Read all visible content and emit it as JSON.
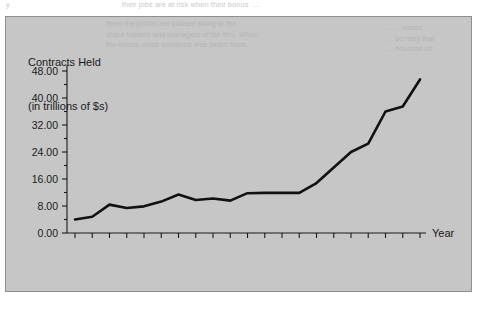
{
  "page": {
    "bleed_top": "y                                                    their jobs are at risk when their bonus  ...",
    "bleed_right": "...... losses\n... so risky that\n... financial cri",
    "bleed_bottom": "",
    "panel_bleed_a": "them the profits are passed along to the\nshare holders and managers of the firm. When\nthe losses occur someone else bears them.",
    "panel_bleed_b": "...... losses\n... so risky that\n... financial cri",
    "panel_bleed_c": ""
  },
  "chart": {
    "title_line1": "Contracts Held",
    "title_line2": "(in trillions of $s)",
    "x_axis_name": "Year"
  },
  "chart_data": {
    "type": "line",
    "title": "Contracts Held (in trillions of $s)",
    "xlabel": "Year",
    "ylabel": "Contracts Held (in trillions of $s)",
    "ylim": [
      0,
      48
    ],
    "yticks": [
      "0.00",
      "8.00",
      "16.00",
      "24.00",
      "32.00",
      "40.00",
      "48.00"
    ],
    "ytick_values": [
      0,
      8,
      16,
      24,
      32,
      40,
      48
    ],
    "xticks": [
      "Dec-92",
      "Dec-94",
      "Dec-96",
      "Dec-98",
      "Dec-00",
      "Dec-02",
      "Dec-04",
      "Dec-06",
      "Dec-08",
      "Dec-10",
      "Dec-12"
    ],
    "grid": false,
    "legend": "none",
    "x": [
      "Dec-92",
      "Dec-93",
      "Dec-94",
      "Dec-95",
      "Dec-96",
      "Dec-97",
      "Dec-98",
      "Dec-99",
      "Dec-00",
      "Dec-01",
      "Dec-02",
      "Dec-03",
      "Dec-04",
      "Dec-05",
      "Dec-06",
      "Dec-07",
      "Dec-08",
      "Dec-09",
      "Dec-10",
      "Dec-11",
      "Dec-12"
    ],
    "values": [
      4.0,
      4.8,
      8.4,
      7.4,
      7.9,
      9.3,
      11.4,
      9.8,
      10.2,
      9.6,
      11.8,
      11.9,
      11.9,
      11.9,
      14.8,
      19.4,
      24.0,
      26.5,
      36.0,
      37.5,
      45.5
    ],
    "series": [
      {
        "name": "Contracts Held",
        "values": [
          4.0,
          4.8,
          8.4,
          7.4,
          7.9,
          9.3,
          11.4,
          9.8,
          10.2,
          9.6,
          11.8,
          11.9,
          11.9,
          11.9,
          14.8,
          19.4,
          24.0,
          26.5,
          36.0,
          37.5,
          45.5
        ]
      }
    ],
    "units": "trillions of dollars"
  }
}
